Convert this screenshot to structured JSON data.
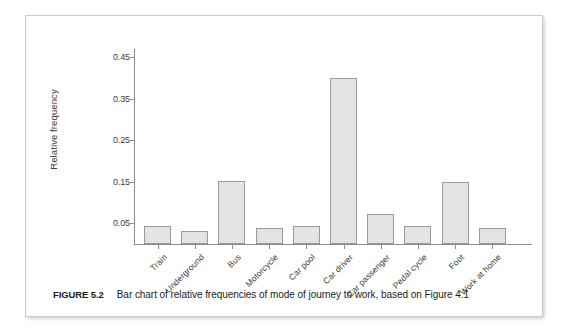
{
  "figure": {
    "number_label": "FIGURE 5.2",
    "caption": "Bar chart of relative frequencies of mode of journey to work, based on Figure 4.1"
  },
  "chart_data": {
    "type": "bar",
    "title": "",
    "xlabel": "",
    "ylabel": "Relative frequency",
    "categories": [
      "Train",
      "Underground",
      "Bus",
      "Motorcycle",
      "Car pool",
      "Car driver",
      "Car passenger",
      "Pedal cycle",
      "Foot",
      "Work at home"
    ],
    "values": [
      0.044,
      0.031,
      0.153,
      0.038,
      0.044,
      0.4,
      0.072,
      0.043,
      0.15,
      0.039
    ],
    "ylim": [
      0.0,
      0.47
    ],
    "ytick_labels": [
      "0.45",
      "0.35",
      "0.25",
      "0.15",
      "0.05"
    ],
    "ytick_values": [
      0.45,
      0.35,
      0.25,
      0.15,
      0.05
    ],
    "grid": false,
    "legend": null,
    "bar_fill_color": "#e4e4e4",
    "bar_border_color": "#9a9a9a",
    "axis_color": "#8c8c8c"
  }
}
